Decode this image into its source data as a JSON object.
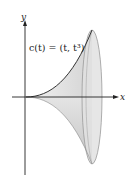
{
  "figure": {
    "y_axis_label": "y",
    "x_axis_label": "x",
    "curve_label": "c(t) = (t, t³)",
    "colors": {
      "axis": "#222222",
      "curve": "#333333",
      "surface_fill": "#e6e6e6",
      "surface_shade": "#c8c8c8",
      "ellipse_fill": "#dedede",
      "ellipse_stroke": "#999999"
    }
  }
}
